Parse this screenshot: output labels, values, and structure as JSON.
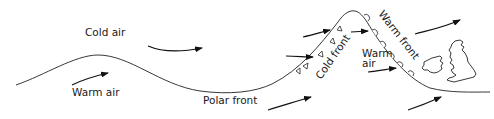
{
  "diagram": {
    "labels": {
      "cold_air": "Cold air",
      "warm_air_left": "Warm air",
      "polar_front": "Polar front",
      "cold_front": "Cold front",
      "warm_front": "Warm front",
      "warm_air_sector_line1": "Warm",
      "warm_air_sector_line2": "air"
    },
    "colors": {
      "line": "#222222",
      "background": "#ffffff"
    },
    "symbols": {
      "cold_front": "triangles",
      "warm_front": "semicircles"
    },
    "map_region": "British Isles"
  }
}
